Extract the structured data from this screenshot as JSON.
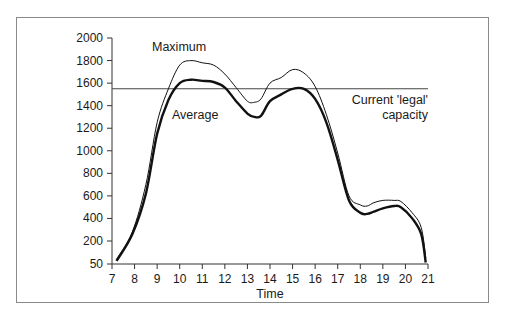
{
  "chart_data": {
    "type": "line",
    "title": "",
    "xlabel": "Time",
    "ylabel": "",
    "x": [
      7.2,
      7.9,
      8.5,
      9.0,
      9.5,
      10.0,
      10.5,
      11.0,
      11.5,
      12.0,
      12.5,
      13.0,
      13.3,
      13.6,
      14.0,
      14.5,
      15.0,
      15.5,
      16.0,
      16.5,
      17.0,
      17.5,
      18.0,
      18.3,
      18.6,
      19.0,
      19.5,
      19.8,
      20.3,
      20.7,
      20.9
    ],
    "series": [
      {
        "name": "Maximum",
        "line": "thin",
        "values": [
          80,
          280,
          700,
          1250,
          1550,
          1760,
          1800,
          1780,
          1760,
          1680,
          1560,
          1440,
          1430,
          1460,
          1600,
          1650,
          1720,
          1690,
          1570,
          1320,
          980,
          600,
          520,
          510,
          540,
          560,
          560,
          550,
          450,
          320,
          90
        ]
      },
      {
        "name": "Average",
        "line": "thick",
        "values": [
          70,
          260,
          620,
          1150,
          1450,
          1600,
          1630,
          1620,
          1610,
          1560,
          1440,
          1330,
          1300,
          1310,
          1440,
          1500,
          1550,
          1550,
          1460,
          1250,
          920,
          560,
          450,
          440,
          460,
          490,
          510,
          500,
          400,
          260,
          60
        ]
      }
    ],
    "reference_lines": [
      {
        "name": "Current 'legal' capacity",
        "y": 1550,
        "x_range": [
          7,
          21
        ]
      }
    ],
    "x_ticks": [
      "7",
      "8",
      "9",
      "10",
      "11",
      "12",
      "13",
      "14",
      "15",
      "16",
      "17",
      "18",
      "19",
      "20",
      "21"
    ],
    "y_ticks": [
      "2000",
      "1800",
      "1600",
      "1400",
      "1200",
      "1000",
      "800",
      "600",
      "400",
      "200",
      "50"
    ],
    "xlim": [
      7,
      21
    ],
    "ylim": [
      50,
      2000
    ],
    "grid": false,
    "legend": "none (inline annotations)"
  },
  "annotations": {
    "maximum": "Maximum",
    "average": "Average",
    "capacity_line1": "Current 'legal'",
    "capacity_line2": "capacity"
  },
  "axes": {
    "x_title": "Time"
  },
  "colors": {
    "line": "#111111",
    "frame": "#8a8a8a",
    "axis": "#333333"
  }
}
